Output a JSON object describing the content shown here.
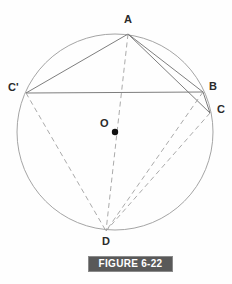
{
  "figure": {
    "caption": "FIGURE 6-22",
    "canvas": {
      "width": 232,
      "height": 284
    },
    "colors": {
      "circle_stroke": "#9a9a9a",
      "solid_line": "#6f6f6f",
      "dashed_line": "#a0a0a0",
      "label_text": "#2a2a2a",
      "caption_bg": "#595959",
      "caption_border": "#8a8a8a",
      "caption_text": "#ffffff",
      "center_dot": "#111111",
      "background": "#fefefe"
    },
    "circle": {
      "cx": 115,
      "cy": 132,
      "r": 98
    },
    "points": [
      {
        "id": "A",
        "label": "A",
        "x": 128,
        "y": 34,
        "label_x": 124,
        "label_y": 14
      },
      {
        "id": "Cp",
        "label": "C'",
        "x": 26,
        "y": 93,
        "label_x": 8,
        "label_y": 82
      },
      {
        "id": "B",
        "label": "B",
        "x": 203,
        "y": 92,
        "label_x": 209,
        "label_y": 81
      },
      {
        "id": "C",
        "label": "C",
        "x": 210,
        "y": 113,
        "label_x": 217,
        "label_y": 104
      },
      {
        "id": "O",
        "label": "O",
        "x": 115,
        "y": 132,
        "label_x": 100,
        "label_y": 118
      },
      {
        "id": "D",
        "label": "D",
        "x": 106,
        "y": 231,
        "label_x": 102,
        "label_y": 236
      }
    ],
    "center_dot": {
      "x": 115,
      "y": 132,
      "r": 3.2
    },
    "solid_segments": [
      {
        "name": "A-Cprime",
        "x1": 128,
        "y1": 34,
        "x2": 26,
        "y2": 93
      },
      {
        "name": "A-B",
        "x1": 128,
        "y1": 34,
        "x2": 203,
        "y2": 92
      },
      {
        "name": "A-C",
        "x1": 128,
        "y1": 34,
        "x2": 210,
        "y2": 113
      },
      {
        "name": "Cprime-B",
        "x1": 26,
        "y1": 93,
        "x2": 203,
        "y2": 92
      },
      {
        "name": "B-C",
        "x1": 203,
        "y1": 92,
        "x2": 210,
        "y2": 113
      }
    ],
    "dashed_segments": [
      {
        "name": "A-D",
        "x1": 128,
        "y1": 34,
        "x2": 106,
        "y2": 231
      },
      {
        "name": "Cprime-D",
        "x1": 26,
        "y1": 93,
        "x2": 106,
        "y2": 231
      },
      {
        "name": "B-D",
        "x1": 203,
        "y1": 92,
        "x2": 106,
        "y2": 231
      },
      {
        "name": "C-D",
        "x1": 210,
        "y1": 113,
        "x2": 106,
        "y2": 231
      }
    ]
  }
}
